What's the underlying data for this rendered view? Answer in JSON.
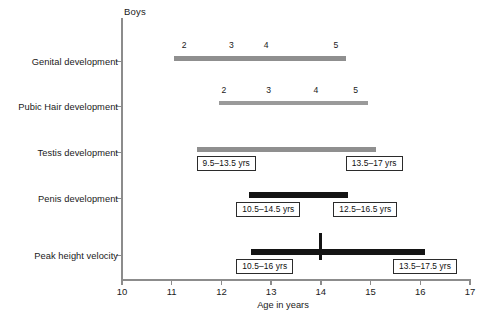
{
  "chart_data": {
    "type": "bar",
    "title": "Boys",
    "xlabel": "Age in years",
    "ylabel": "",
    "xlim": [
      10,
      17
    ],
    "xticks": [
      10,
      11,
      12,
      13,
      14,
      15,
      16,
      17
    ],
    "grid": false,
    "legend": "none",
    "categories": [
      "Genital development",
      "Pubic Hair development",
      "Testis development",
      "Penis development",
      "Peak height velocity"
    ],
    "series": [
      {
        "name": "Genital development",
        "start": 11.05,
        "end": 14.5,
        "color": "#8f8f8f",
        "stage_marks": [
          {
            "label": "2",
            "age": 11.25
          },
          {
            "label": "3",
            "age": 12.2
          },
          {
            "label": "4",
            "age": 12.9
          },
          {
            "label": "5",
            "age": 14.3
          }
        ],
        "callouts": []
      },
      {
        "name": "Pubic Hair development",
        "start": 11.95,
        "end": 14.95,
        "color": "#9a9a9a",
        "stage_marks": [
          {
            "label": "2",
            "age": 12.05
          },
          {
            "label": "3",
            "age": 12.95
          },
          {
            "label": "4",
            "age": 13.9
          },
          {
            "label": "5",
            "age": 14.7
          }
        ],
        "callouts": []
      },
      {
        "name": "Testis development",
        "start": 11.5,
        "end": 15.1,
        "color": "#8f8f8f",
        "stage_marks": [],
        "callouts": [
          {
            "text": "9.5–13.5 yrs",
            "age": 11.5,
            "align": "left"
          },
          {
            "text": "13.5–17 yrs",
            "age": 14.5,
            "align": "left"
          }
        ]
      },
      {
        "name": "Penis development",
        "start": 12.55,
        "end": 14.55,
        "color": "#141414",
        "stage_marks": [],
        "callouts": [
          {
            "text": "10.5–14.5 yrs",
            "age": 12.3,
            "align": "left"
          },
          {
            "text": "12.5–16.5 yrs",
            "age": 14.25,
            "align": "left"
          }
        ]
      },
      {
        "name": "Peak height velocity",
        "start": 12.6,
        "end": 16.1,
        "color": "#141414",
        "peak_marker_age": 14.0,
        "stage_marks": [],
        "callouts": [
          {
            "text": "10.5–16 yrs",
            "age": 12.3,
            "align": "left"
          },
          {
            "text": "13.5–17.5 yrs",
            "age": 15.45,
            "align": "left"
          }
        ]
      }
    ]
  },
  "caption_remnant": ""
}
